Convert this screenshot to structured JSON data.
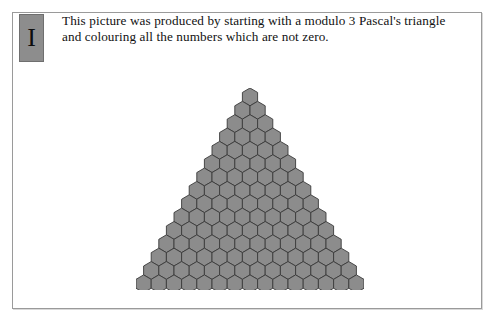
{
  "page": {
    "background_color": "#ffffff",
    "frame_border_color": "#9a9a9a"
  },
  "badge": {
    "name": "info-badge",
    "glyph": "I",
    "fill_color": "#8d8d8d",
    "glyph_color": "#0d0d0d"
  },
  "caption": {
    "text": "This picture was produced by starting with a modulo 3 Pascal's triangle and colouring all the numbers which are not zero.",
    "color": "#111111"
  },
  "figure": {
    "name": "modulo-3-pascal-triangle",
    "shape": "triangle-of-hexagons",
    "rows": 15,
    "hex_fill_color": "#8c8c8c",
    "hex_stroke_color": "#3a3a3a",
    "hex_width": 15.2,
    "hex_row_height": 13.35,
    "bounds": {
      "left": 136,
      "top": 88,
      "width": 228,
      "height": 202
    },
    "coloured_rule": "numbers not equal to zero (mod 3) are coloured",
    "row_counts": [
      1,
      2,
      3,
      4,
      5,
      6,
      7,
      8,
      9,
      10,
      11,
      12,
      13,
      14,
      15
    ]
  }
}
